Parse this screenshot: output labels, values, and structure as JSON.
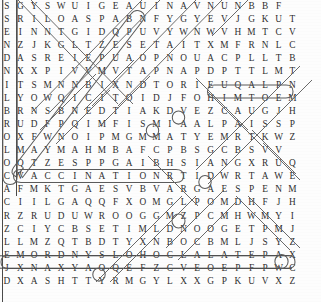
{
  "puzzle": {
    "type": "word-search",
    "rows": 22,
    "cols": 22,
    "grid": [
      [
        "S",
        "G",
        "Y",
        "S",
        "W",
        "U",
        "I",
        "G",
        "E",
        "A",
        "U",
        "I",
        "N",
        "A",
        "V",
        "N",
        "U",
        "N",
        "B",
        "B",
        "F",
        ""
      ],
      [
        "S",
        "R",
        "I",
        "L",
        "O",
        "A",
        "S",
        "P",
        "A",
        "B",
        "N",
        "F",
        "Y",
        "G",
        "Y",
        "E",
        "V",
        "J",
        "G",
        "K",
        "U",
        "T"
      ],
      [
        "E",
        "I",
        "N",
        "N",
        "T",
        "G",
        "I",
        "D",
        "Q",
        "P",
        "U",
        "V",
        "Y",
        "W",
        "N",
        "W",
        "V",
        "H",
        "M",
        "T",
        "C",
        "V"
      ],
      [
        "N",
        "Z",
        "J",
        "K",
        "G",
        "L",
        "T",
        "Z",
        "E",
        "S",
        "E",
        "T",
        "A",
        "I",
        "T",
        "X",
        "M",
        "F",
        "R",
        "N",
        "L",
        "C"
      ],
      [
        "D",
        "A",
        "S",
        "R",
        "E",
        "I",
        "E",
        "P",
        "U",
        "A",
        "O",
        "P",
        "N",
        "O",
        "U",
        "A",
        "C",
        "P",
        "L",
        "L",
        "T",
        "B"
      ],
      [
        "N",
        "X",
        "X",
        "P",
        "I",
        "V",
        "V",
        "M",
        "V",
        "T",
        "A",
        "P",
        "N",
        "A",
        "P",
        "D",
        "P",
        "T",
        "T",
        "L",
        "M",
        "T"
      ],
      [
        "I",
        "T",
        "S",
        "M",
        "N",
        "N",
        "B",
        "I",
        "X",
        "N",
        "D",
        "T",
        "O",
        "R",
        "I",
        "E",
        "U",
        "Q",
        "A",
        "L",
        "P",
        "N"
      ],
      [
        "L",
        "Y",
        "O",
        "W",
        "Q",
        "I",
        "C",
        "I",
        "T",
        "O",
        "I",
        "D",
        "J",
        "F",
        "O",
        "H",
        "I",
        "M",
        "T",
        "O",
        "E",
        "M"
      ],
      [
        "B",
        "R",
        "N",
        "S",
        "B",
        "N",
        "E",
        "D",
        "T",
        "I",
        "A",
        "K",
        "D",
        "V",
        "E",
        "Z",
        "C",
        "A",
        "U",
        "G",
        "J",
        "H"
      ],
      [
        "R",
        "U",
        "D",
        "F",
        "P",
        "Q",
        "I",
        "M",
        "F",
        "I",
        "S",
        "M",
        "I",
        "A",
        "A",
        "L",
        "P",
        "A",
        "I",
        "S",
        "S",
        "P"
      ],
      [
        "O",
        "X",
        "F",
        "W",
        "N",
        "O",
        "I",
        "P",
        "M",
        "G",
        "M",
        "M",
        "A",
        "T",
        "Y",
        "E",
        "M",
        "R",
        "T",
        "K",
        "W",
        "Z"
      ],
      [
        "L",
        "M",
        "A",
        "Y",
        "M",
        "A",
        "H",
        "M",
        "B",
        "A",
        "F",
        "C",
        "P",
        "B",
        "S",
        "G",
        "C",
        "B",
        "S",
        "V",
        "V",
        ""
      ],
      [
        "O",
        "Q",
        "T",
        "Z",
        "E",
        "S",
        "P",
        "P",
        "G",
        "A",
        "I",
        "B",
        "H",
        "S",
        "I",
        "A",
        "N",
        "G",
        "X",
        "R",
        "U",
        "Q"
      ],
      [
        "C",
        "V",
        "A",
        "C",
        "C",
        "I",
        "N",
        "A",
        "T",
        "I",
        "O",
        "N",
        "R",
        "T",
        "I",
        "D",
        "W",
        "R",
        "T",
        "A",
        "W",
        "E"
      ],
      [
        "A",
        "F",
        "M",
        "K",
        "T",
        "G",
        "A",
        "E",
        "S",
        "V",
        "B",
        "V",
        "A",
        "R",
        "G",
        "A",
        "E",
        "S",
        "P",
        "E",
        "N",
        "M"
      ],
      [
        "C",
        "I",
        "I",
        "L",
        "G",
        "A",
        "Q",
        "Q",
        "F",
        "X",
        "O",
        "M",
        "G",
        "L",
        "P",
        "O",
        "M",
        "D",
        "H",
        "F",
        "J",
        "H"
      ],
      [
        "R",
        "Z",
        "R",
        "U",
        "D",
        "U",
        "W",
        "R",
        "O",
        "O",
        "G",
        "G",
        "M",
        "Z",
        "P",
        "C",
        "M",
        "H",
        "W",
        "M",
        "Y",
        "I"
      ],
      [
        "Z",
        "C",
        "I",
        "Y",
        "C",
        "B",
        "S",
        "E",
        "T",
        "I",
        "M",
        "L",
        "D",
        "N",
        "O",
        "O",
        "G",
        "E",
        "T",
        "P",
        "M",
        "J"
      ],
      [
        "L",
        "L",
        "M",
        "Z",
        "Q",
        "T",
        "B",
        "D",
        "T",
        "Y",
        "X",
        "N",
        "B",
        "O",
        "C",
        "B",
        "M",
        "L",
        "J",
        "S",
        "Y",
        "Z"
      ],
      [
        "E",
        "M",
        "O",
        "R",
        "D",
        "N",
        "Y",
        "S",
        "L",
        "O",
        "H",
        "O",
        "C",
        "L",
        "A",
        "L",
        "A",
        "T",
        "E",
        "P",
        "A",
        "X"
      ],
      [
        "J",
        "X",
        "N",
        "A",
        "X",
        "Y",
        "A",
        "O",
        "Q",
        "E",
        "F",
        "Z",
        "C",
        "V",
        "E",
        "O",
        "E",
        "P",
        "F",
        "P",
        "W",
        "C"
      ],
      [
        "D",
        "X",
        "A",
        "S",
        "H",
        "T",
        "T",
        "Y",
        "R",
        "M",
        "G",
        "Y",
        "L",
        "X",
        "X",
        "G",
        "P",
        "K",
        "U",
        "V",
        "X",
        "Z"
      ]
    ],
    "found_words": [
      {
        "text": "PLAQUE",
        "direction": "horizontal-reversed",
        "row": 6,
        "start_col": 20,
        "end_col": 15
      },
      {
        "text": "VACCINATION",
        "direction": "horizontal",
        "row": 13,
        "start_col": 1,
        "end_col": 11
      },
      {
        "text": "COLORBLINDNESS",
        "direction": "vertical-reversed",
        "col": 0,
        "start_row": 13,
        "end_row": 0
      },
      {
        "text": "SYNDROME",
        "direction": "horizontal-reversed",
        "row": 19,
        "start_col": 7,
        "end_col": 0
      },
      {
        "text": "ALCOHOLS",
        "direction": "horizontal-reversed",
        "row": 19,
        "start_col": 15,
        "end_col": 8
      },
      {
        "text": "PETALA",
        "direction": "horizontal",
        "row": 19,
        "start_col": 16,
        "end_col": 20
      },
      {
        "text": "diagonal-word-1",
        "direction": "diagonal-up-right"
      },
      {
        "text": "diagonal-word-2",
        "direction": "diagonal-down-right"
      }
    ],
    "colors": {
      "letter": "#2e2e2e",
      "loop_stroke": "#5b5b5b",
      "slash_stroke": "#6a6a6a",
      "border": "#4a4a4a",
      "paper": "#fdfdfd"
    }
  }
}
